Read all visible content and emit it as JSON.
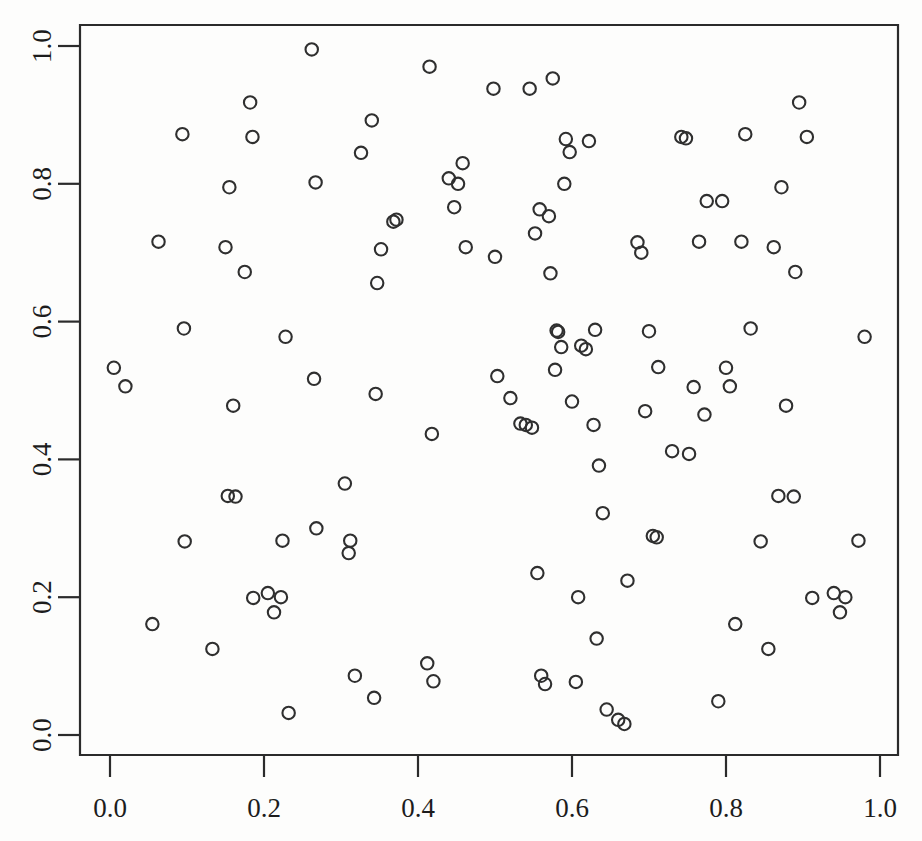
{
  "chart_data": {
    "type": "scatter",
    "title": "",
    "subtitle": "",
    "xlabel": "",
    "ylabel": "",
    "xlim": [
      -0.02,
      1.02
    ],
    "ylim": [
      -0.02,
      1.02
    ],
    "grid": false,
    "legend": null,
    "marker": "open-circle",
    "marker_color": "#2f2f2f",
    "n_points": 118,
    "xticks": [
      0.0,
      0.2,
      0.4,
      0.6,
      0.8,
      1.0
    ],
    "yticks": [
      0.0,
      0.2,
      0.4,
      0.6,
      0.8,
      1.0
    ],
    "xtick_labels": [
      "0.0",
      "0.2",
      "0.4",
      "0.6",
      "0.8",
      "1.0"
    ],
    "ytick_labels": [
      "0.0",
      "0.2",
      "0.4",
      "0.6",
      "0.8",
      "1.0"
    ],
    "x": [
      0.005,
      0.02,
      0.055,
      0.063,
      0.094,
      0.096,
      0.097,
      0.133,
      0.15,
      0.153,
      0.155,
      0.16,
      0.163,
      0.175,
      0.182,
      0.185,
      0.186,
      0.205,
      0.213,
      0.222,
      0.224,
      0.228,
      0.232,
      0.262,
      0.265,
      0.267,
      0.268,
      0.305,
      0.31,
      0.312,
      0.318,
      0.326,
      0.34,
      0.343,
      0.345,
      0.347,
      0.352,
      0.368,
      0.372,
      0.412,
      0.415,
      0.418,
      0.42,
      0.44,
      0.447,
      0.452,
      0.458,
      0.462,
      0.498,
      0.5,
      0.503,
      0.52,
      0.533,
      0.54,
      0.545,
      0.548,
      0.552,
      0.555,
      0.558,
      0.56,
      0.565,
      0.57,
      0.572,
      0.575,
      0.578,
      0.58,
      0.582,
      0.586,
      0.59,
      0.592,
      0.597,
      0.6,
      0.605,
      0.608,
      0.612,
      0.618,
      0.622,
      0.628,
      0.63,
      0.632,
      0.635,
      0.64,
      0.645,
      0.66,
      0.668,
      0.672,
      0.685,
      0.69,
      0.695,
      0.7,
      0.705,
      0.71,
      0.712,
      0.73,
      0.742,
      0.748,
      0.752,
      0.758,
      0.765,
      0.772,
      0.775,
      0.79,
      0.795,
      0.8,
      0.805,
      0.812,
      0.82,
      0.825,
      0.832,
      0.845,
      0.855,
      0.862,
      0.868,
      0.872,
      0.878,
      0.888,
      0.89,
      0.895,
      0.905,
      0.912,
      0.94,
      0.948,
      0.955,
      0.972,
      0.98
    ],
    "y": [
      0.533,
      0.506,
      0.161,
      0.716,
      0.872,
      0.59,
      0.281,
      0.125,
      0.708,
      0.347,
      0.795,
      0.478,
      0.346,
      0.672,
      0.918,
      0.868,
      0.199,
      0.206,
      0.178,
      0.2,
      0.282,
      0.578,
      0.032,
      0.995,
      0.517,
      0.802,
      0.3,
      0.365,
      0.264,
      0.282,
      0.086,
      0.845,
      0.892,
      0.054,
      0.495,
      0.656,
      0.705,
      0.745,
      0.748,
      0.104,
      0.97,
      0.437,
      0.078,
      0.808,
      0.766,
      0.8,
      0.83,
      0.708,
      0.938,
      0.694,
      0.521,
      0.489,
      0.452,
      0.45,
      0.938,
      0.446,
      0.728,
      0.235,
      0.763,
      0.086,
      0.074,
      0.753,
      0.67,
      0.953,
      0.53,
      0.587,
      0.585,
      0.563,
      0.8,
      0.865,
      0.846,
      0.484,
      0.077,
      0.2,
      0.565,
      0.56,
      0.862,
      0.45,
      0.588,
      0.14,
      0.391,
      0.322,
      0.037,
      0.022,
      0.016,
      0.224,
      0.715,
      0.7,
      0.47,
      0.586,
      0.289,
      0.287,
      0.534,
      0.412,
      0.868,
      0.866,
      0.408,
      0.505,
      0.716,
      0.465,
      0.775,
      0.049,
      0.775,
      0.533,
      0.506,
      0.161,
      0.716,
      0.872,
      0.59,
      0.281,
      0.125,
      0.708,
      0.347,
      0.795,
      0.478,
      0.346,
      0.672,
      0.918,
      0.868,
      0.199,
      0.206,
      0.178,
      0.2,
      0.282,
      0.578
    ]
  },
  "axes": {
    "x_axis_name": "x-axis",
    "y_axis_name": "y-axis",
    "box_color": "#2b2b2b"
  }
}
